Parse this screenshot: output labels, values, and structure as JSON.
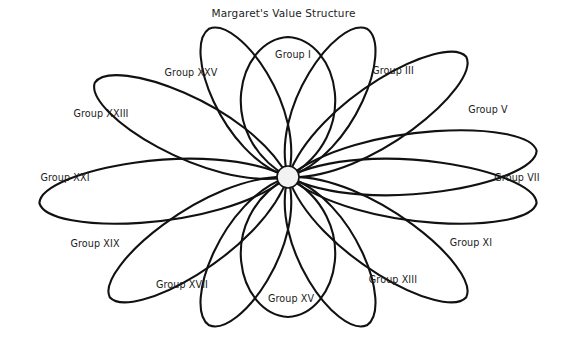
{
  "figure": {
    "title": "Margaret's Value Structure",
    "type": "radial-petal-diagram",
    "background_color": "#ffffff",
    "line_color": "#111111",
    "text_color": "#1b1b1b",
    "hub_fill_color": "#f2f2f2",
    "petal_count": 13,
    "center": {
      "x": 288,
      "y": 177
    },
    "hub_radius": 11
  },
  "chart_data": {
    "type": "pie",
    "title": "Margaret's Value Structure",
    "xlabel": "",
    "ylabel": "",
    "categories": [
      "Group I",
      "Group III",
      "Group V",
      "Group VII",
      "Group XI",
      "Group XIII",
      "Group XV",
      "Group XVII",
      "Group XIX",
      "Group XXI",
      "Group XXIII",
      "Group XXV"
    ],
    "values": [
      1,
      1,
      1,
      1,
      1,
      1,
      1,
      1,
      1,
      1,
      1,
      1
    ],
    "legend_position": "none",
    "grid": false
  },
  "petals": [
    {
      "label": "Group I",
      "angle_deg": -90,
      "length": 140,
      "width": 96,
      "label_x": 293,
      "label_y": 54
    },
    {
      "label": "Group III",
      "angle_deg": -62,
      "length": 168,
      "width": 62,
      "label_x": 393,
      "label_y": 70
    },
    {
      "label": "Group V",
      "angle_deg": -34,
      "length": 215,
      "width": 62,
      "label_x": 488,
      "label_y": 109
    },
    {
      "label": "Group VII",
      "angle_deg": -6,
      "length": 250,
      "width": 62,
      "label_x": 517,
      "label_y": 177
    },
    {
      "label": "Group XI",
      "angle_deg": 34,
      "length": 215,
      "width": 62,
      "label_x": 471,
      "label_y": 242
    },
    {
      "label": "Group XIII",
      "angle_deg": 62,
      "length": 168,
      "width": 62,
      "label_x": 393,
      "label_y": 279
    },
    {
      "label": "Group XV",
      "angle_deg": 90,
      "length": 140,
      "width": 96,
      "label_x": 291,
      "label_y": 298
    },
    {
      "label": "Group XVII",
      "angle_deg": 118,
      "length": 168,
      "width": 62,
      "label_x": 182,
      "label_y": 284
    },
    {
      "label": "Group XIX",
      "angle_deg": 146,
      "length": 215,
      "width": 62,
      "label_x": 95,
      "label_y": 243
    },
    {
      "label": "Group XXI",
      "angle_deg": 174,
      "length": 250,
      "width": 62,
      "label_x": 65,
      "label_y": 177
    },
    {
      "label": "Group XXIII",
      "angle_deg": -154,
      "length": 215,
      "width": 62,
      "label_x": 101,
      "label_y": 113
    },
    {
      "label": "Group XXV",
      "angle_deg": -118,
      "length": 168,
      "width": 62,
      "label_x": 191,
      "label_y": 72
    },
    {
      "label": "",
      "angle_deg": 6,
      "length": 250,
      "width": 62,
      "label_x": -999,
      "label_y": -999
    }
  ]
}
